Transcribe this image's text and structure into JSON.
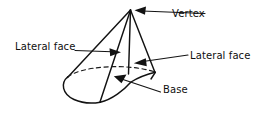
{
  "figure": {
    "kind": "geometry-diagram",
    "background_color": "#ffffff",
    "ink_color": "#121212",
    "width": 261,
    "height": 113
  },
  "labels": {
    "vertex": "Vertex",
    "lateral_face_left": "Lateral face",
    "lateral_face_right": "Lateral face",
    "base": "Base"
  },
  "annotations": [
    {
      "name": "vertex",
      "text": "Vertex",
      "leader_from": [
        205,
        14
      ],
      "leader_to": [
        140,
        11
      ],
      "arrow_direction": "left"
    },
    {
      "name": "lateral-face-left",
      "text": "Lateral face",
      "leader_from": [
        75,
        50
      ],
      "leader_to": [
        121,
        52
      ],
      "arrow_direction": "right"
    },
    {
      "name": "lateral-face-right",
      "text": "Lateral face",
      "leader_from": [
        188,
        55
      ],
      "leader_to": [
        134,
        63
      ],
      "arrow_direction": "left"
    },
    {
      "name": "base",
      "text": "Base",
      "leader_from": [
        160,
        92
      ],
      "leader_to": [
        114,
        77
      ],
      "arrow_direction": "upper-left"
    }
  ],
  "geometry": {
    "apex": [
      130,
      10
    ],
    "base_left_tip": [
      67,
      77
    ],
    "base_right_vertex": [
      155,
      72
    ],
    "base_bottom_vertex": [
      100,
      102
    ],
    "edges_from_apex": [
      [
        67,
        77
      ],
      [
        100,
        102
      ],
      [
        128,
        74
      ],
      [
        155,
        72
      ]
    ],
    "base_front_arc": "solid",
    "base_back_arc": "dashed"
  }
}
